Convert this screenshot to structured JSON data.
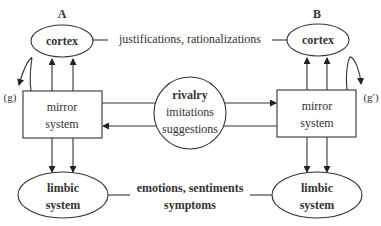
{
  "diagram": {
    "side_a": {
      "label": "A",
      "cortex": "cortex",
      "mirror_line1": "mirror",
      "mirror_line2": "system",
      "limbic_line1": "limbic",
      "limbic_line2": "system",
      "loop_label": "(g)"
    },
    "side_b": {
      "label": "B",
      "cortex": "cortex",
      "mirror_line1": "mirror",
      "mirror_line2": "system",
      "limbic_line1": "limbic",
      "limbic_line2": "system",
      "loop_label": "(g′)"
    },
    "cortex_link": "justifications, rationalizations",
    "center": {
      "title": "rivalry",
      "line2": "imitations",
      "line3": "suggestions"
    },
    "limbic_link_line1": "emotions, sentiments",
    "limbic_link_line2": "symptoms"
  }
}
